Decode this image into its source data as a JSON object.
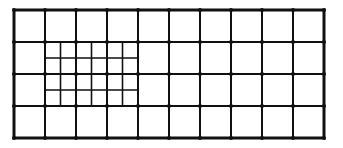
{
  "diagram": {
    "type": "mesh-grid",
    "colors": {
      "line": "#111111",
      "background": "#ffffff",
      "node": "#111111"
    },
    "outer": {
      "x0": 14,
      "y0": 10,
      "x1": 324,
      "y1": 138,
      "stroke": 3
    },
    "coarse": {
      "cols": 10,
      "rows": 4,
      "stroke": 2
    },
    "refined_region": {
      "col_start": 1,
      "col_end": 4,
      "row_start": 1,
      "row_end": 3,
      "subdivision": 2,
      "stroke": 1.6
    },
    "node_radius": 2
  }
}
